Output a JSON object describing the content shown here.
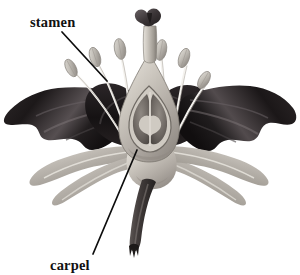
{
  "figure": {
    "background_color": "#ffffff",
    "width": 300,
    "height": 275
  },
  "labels": [
    {
      "id": "stamen",
      "text": "stamen",
      "text_x": 30,
      "text_y": 27,
      "leader": {
        "x1": 62,
        "y1": 32,
        "x2": 107,
        "y2": 81
      },
      "color": "#111111"
    },
    {
      "id": "carpel",
      "text": "carpel",
      "text_x": 76,
      "text_y": 270,
      "leader": {
        "x1": 93,
        "y1": 254,
        "x2": 137,
        "y2": 150
      },
      "color": "#111111"
    }
  ],
  "palette": {
    "tepal_dark": "#231f20",
    "tepal_dark_mid": "#3b3537",
    "tepal_dark_light": "#5d5659",
    "tepal_light": "#b9b4ae",
    "tepal_light_hi": "#d8d4cd",
    "tepal_light_shadow": "#8c8781",
    "carpel_body": "#cfcac2",
    "carpel_shade": "#9b958d",
    "ovary_inner": "#7c7670",
    "ovary_dark": "#56504c",
    "anther": "#c6c2bb",
    "anther_shade": "#9d9891",
    "filament": "#f2f0ec",
    "filament_edge": "#b5b0a9",
    "stigma": "#4a4446",
    "stem": "#4e4846",
    "stem_dark": "#2b2726",
    "outline": "#1a1a1a"
  },
  "parts": {
    "stigma_label": "stigma",
    "style_label": "style",
    "ovary_label": "ovary",
    "anther_label": "anther",
    "filament_label": "filament",
    "tepal_upper_label": "upper tepal",
    "tepal_lower_label": "lower tepal",
    "stem_label": "stem"
  },
  "stamens": [
    {
      "id": 1,
      "anther_x": 71,
      "anther_y": 68,
      "angle": -28,
      "base_x": 126,
      "base_y": 142
    },
    {
      "id": 2,
      "anther_x": 95,
      "anther_y": 57,
      "angle": -20,
      "base_x": 130,
      "base_y": 143
    },
    {
      "id": 3,
      "anther_x": 120,
      "anther_y": 49,
      "angle": -13,
      "base_x": 133,
      "base_y": 144
    },
    {
      "id": 4,
      "anther_x": 161,
      "anther_y": 50,
      "angle": 13,
      "base_x": 166,
      "base_y": 144
    },
    {
      "id": 5,
      "anther_x": 184,
      "anther_y": 58,
      "angle": 20,
      "base_x": 169,
      "base_y": 143
    },
    {
      "id": 6,
      "anther_x": 203,
      "anther_y": 79,
      "angle": 30,
      "base_x": 172,
      "base_y": 142
    }
  ]
}
